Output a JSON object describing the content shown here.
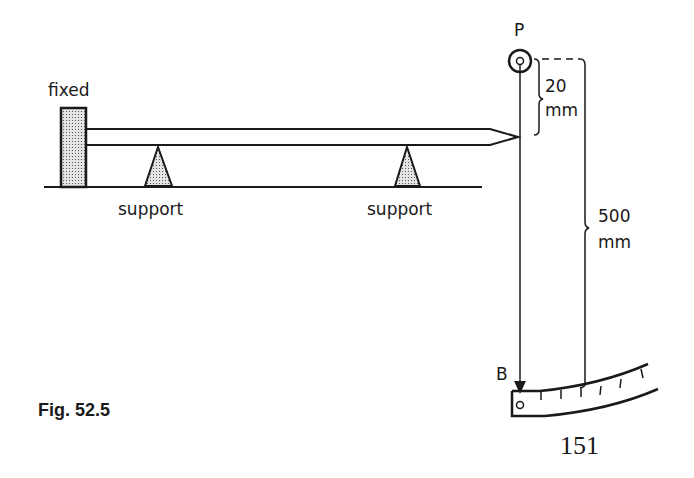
{
  "figure": {
    "caption": "Fig. 52.5",
    "page_number": "151"
  },
  "labels": {
    "fixed": "fixed",
    "support_left": "support",
    "support_right": "support",
    "pivot": "P",
    "pointer_end": "B",
    "short_dimension_value": "20",
    "short_dimension_unit": "mm",
    "long_dimension_value": "500",
    "long_dimension_unit": "mm"
  },
  "diagram": {
    "components": [
      "fixed block",
      "rod",
      "two supports",
      "pivot P",
      "pointer PB",
      "curved scale"
    ],
    "dimensions": [
      {
        "label": "20 mm",
        "from": "pivot P",
        "to": "rod tip"
      },
      {
        "label": "500 mm",
        "from": "pivot P",
        "to": "scale at B"
      }
    ]
  },
  "colors": {
    "ink": "#1a1a1a",
    "hatch": "#bfbfbf",
    "background": "#ffffff"
  }
}
